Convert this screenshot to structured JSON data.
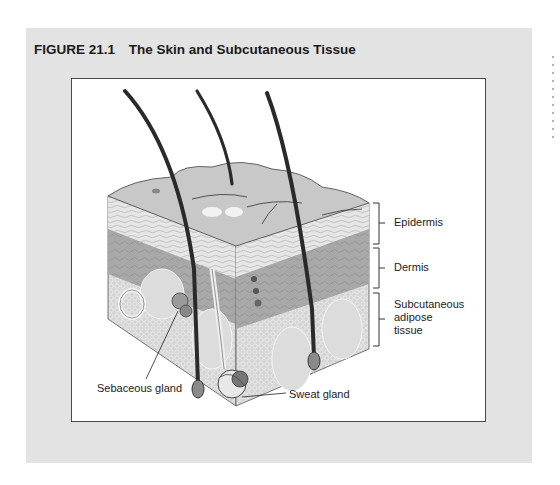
{
  "figure": {
    "number": "FIGURE 21.1",
    "title": "The Skin and Subcutaneous Tissue"
  },
  "labels": {
    "epidermis": "Epidermis",
    "dermis": "Dermis",
    "subcutaneous_line1": "Subcutaneous",
    "subcutaneous_line2": "adipose",
    "subcutaneous_line3": "tissue",
    "sebaceous_gland": "Sebaceous gland",
    "sweat_gland": "Sweat gland"
  },
  "colors": {
    "panel_background": "#e3e3e3",
    "figure_background": "#ffffff",
    "hair": "#2a2a2a",
    "epidermis_surface": "#c4c4c4",
    "dermis": "#9e9e9e",
    "adipose": "#d2d2d2"
  }
}
